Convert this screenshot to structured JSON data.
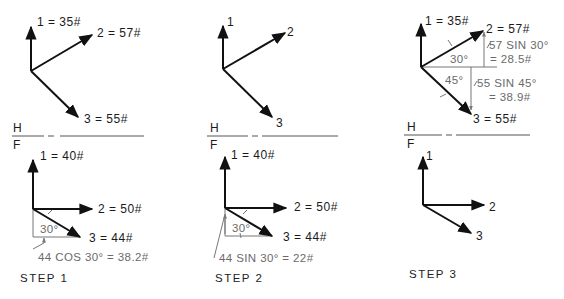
{
  "figure": {
    "fold_line": {
      "top_label": "H",
      "bottom_label": "F"
    },
    "panels": [
      {
        "step_label": "STEP 1",
        "top_view": {
          "v1": "1 = 35#",
          "v2": "2 = 57#",
          "v3": "3 = 55#"
        },
        "front_view": {
          "v1": "1 = 40#",
          "v2": "2 = 50#",
          "v3": "3 = 44#",
          "angle": "30°",
          "component_note": "44 COS 30° = 38.2#"
        }
      },
      {
        "step_label": "STEP 2",
        "top_view": {
          "v1": "1",
          "v2": "2",
          "v3": "3"
        },
        "front_view": {
          "v1": "1 = 40#",
          "v2": "2 = 50#",
          "v3": "3 = 44#",
          "angle": "30°",
          "component_note": "44 SIN 30° = 22#"
        }
      },
      {
        "step_label": "STEP 3",
        "top_view": {
          "v1": "1 = 35#",
          "v2": "2 = 57#",
          "v3": "3 = 55#",
          "angle_upper": "30°",
          "angle_lower": "45°",
          "component_note_1a": "57 SIN 30°",
          "component_note_1b": "= 28.5#",
          "component_note_2a": "55 SIN 45°",
          "component_note_2b": "= 38.9#"
        },
        "front_view": {
          "v1": "1",
          "v2": "2",
          "v3": "3"
        }
      }
    ]
  }
}
